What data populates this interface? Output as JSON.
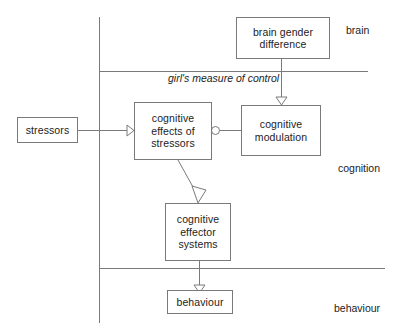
{
  "diagram": {
    "line_color": "#7a7a7a",
    "text_color": "#1c1c1c",
    "background": "#ffffff",
    "nodes": [
      {
        "id": "stressors",
        "label": "stressors",
        "lines": [
          "stressors"
        ],
        "x": 17,
        "y": 117,
        "w": 61,
        "h": 26
      },
      {
        "id": "brain-gender-difference",
        "label": "brain gender difference",
        "lines": [
          "brain gender",
          "difference"
        ],
        "x": 236,
        "y": 17,
        "w": 94,
        "h": 42
      },
      {
        "id": "cognitive-effects-of-stressors",
        "label": "cognitive effects of stressors",
        "lines": [
          "cognitive",
          "effects of",
          "stressors"
        ],
        "x": 134,
        "y": 102,
        "w": 78,
        "h": 58
      },
      {
        "id": "cognitive-modulation",
        "label": "cognitive modulation",
        "lines": [
          "cognitive",
          "modulation"
        ],
        "x": 241,
        "y": 105,
        "w": 80,
        "h": 51
      },
      {
        "id": "cognitive-effector-systems",
        "label": "cognitive effector systems",
        "lines": [
          "cognitive",
          "effector",
          "systems"
        ],
        "x": 165,
        "y": 203,
        "w": 66,
        "h": 58
      },
      {
        "id": "behaviour",
        "label": "behaviour",
        "lines": [
          "behaviour"
        ],
        "x": 167,
        "y": 290,
        "w": 66,
        "h": 24
      }
    ],
    "zone_labels": [
      {
        "id": "brain",
        "text": "brain",
        "x": 346,
        "y": 24
      },
      {
        "id": "cognition",
        "text": "cognition",
        "x": 338,
        "y": 162
      },
      {
        "id": "behaviour",
        "text": "behaviour",
        "x": 334,
        "y": 302
      }
    ],
    "edge_labels": [
      {
        "id": "girls-measure-of-control",
        "lines": [
          "girl's measure",
          "of control"
        ],
        "x": 168,
        "y": 72,
        "w": 90
      }
    ],
    "edges": [
      {
        "id": "stressors-to-cognitive-effects",
        "from": "stressors",
        "to": "cognitive-effects-of-stressors",
        "arrow": "open-triangle"
      },
      {
        "id": "brain-gender-to-cognitive-modulation",
        "from": "brain-gender-difference",
        "to": "cognitive-modulation",
        "arrow": "open-triangle"
      },
      {
        "id": "cognitive-modulation-to-cognitive-effects",
        "from": "cognitive-modulation",
        "to": "cognitive-effects-of-stressors",
        "arrow": "open-circle"
      },
      {
        "id": "cognitive-effects-to-effector-systems",
        "from": "cognitive-effects-of-stressors",
        "to": "cognitive-effector-systems",
        "arrow": "open-triangle"
      },
      {
        "id": "effector-systems-to-behaviour",
        "from": "cognitive-effector-systems",
        "to": "behaviour",
        "arrow": "open-triangle"
      }
    ],
    "dividers": [
      {
        "id": "axis-vertical",
        "orientation": "vertical",
        "x": 99,
        "y1": 17,
        "y2": 323
      },
      {
        "id": "divider-brain-cognition",
        "orientation": "horizontal",
        "y": 71,
        "x1": 99,
        "x2": 368
      },
      {
        "id": "divider-cognition-behaviour",
        "orientation": "horizontal",
        "y": 268,
        "x1": 99,
        "x2": 385
      }
    ]
  }
}
